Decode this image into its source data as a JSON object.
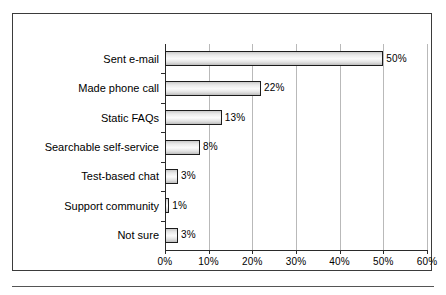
{
  "chart_data": {
    "type": "bar",
    "orientation": "horizontal",
    "title": "",
    "xlabel": "",
    "ylabel": "",
    "categories": [
      "Sent e-mail",
      "Made phone call",
      "Static FAQs",
      "Searchable self-service",
      "Test-based chat",
      "Support community",
      "Not sure"
    ],
    "values": [
      50,
      22,
      13,
      8,
      3,
      1,
      3
    ],
    "value_labels": [
      "50%",
      "22%",
      "13%",
      "8%",
      "3%",
      "1%",
      "3%"
    ],
    "xlim": [
      0,
      60
    ],
    "xticks": [
      0,
      10,
      20,
      30,
      40,
      50,
      60
    ],
    "xtick_labels": [
      "0%",
      "10%",
      "20%",
      "30%",
      "40%",
      "50%",
      "60%"
    ],
    "grid": "vertical",
    "legend": null,
    "bar_fill": "#eeeeee",
    "bar_border": "#1c1c1c",
    "gridline_color": "#b9b9b9",
    "axis_color": "#2a2a2a",
    "frame_color": "#3b3b3b"
  }
}
